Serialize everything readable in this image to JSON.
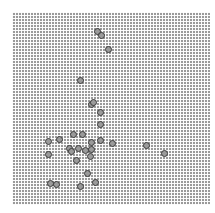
{
  "grid": {
    "x": 12,
    "y": 12,
    "width": 198,
    "height": 193,
    "pitch": 3,
    "cell_color": "#9a9a9a",
    "gap_color": "#ffffff"
  },
  "dot_color": "#3a3a3a",
  "dots": [
    {
      "x": 97,
      "y": 31
    },
    {
      "x": 101,
      "y": 35
    },
    {
      "x": 108,
      "y": 49
    },
    {
      "x": 80,
      "y": 80
    },
    {
      "x": 91,
      "y": 104
    },
    {
      "x": 93,
      "y": 102
    },
    {
      "x": 100,
      "y": 112
    },
    {
      "x": 100,
      "y": 124
    },
    {
      "x": 112,
      "y": 143
    },
    {
      "x": 146,
      "y": 145
    },
    {
      "x": 164,
      "y": 153
    },
    {
      "x": 48,
      "y": 141
    },
    {
      "x": 59,
      "y": 139
    },
    {
      "x": 48,
      "y": 154
    },
    {
      "x": 73,
      "y": 134
    },
    {
      "x": 82,
      "y": 134
    },
    {
      "x": 69,
      "y": 148
    },
    {
      "x": 71,
      "y": 151
    },
    {
      "x": 78,
      "y": 148
    },
    {
      "x": 85,
      "y": 150
    },
    {
      "x": 91,
      "y": 142
    },
    {
      "x": 91,
      "y": 149
    },
    {
      "x": 90,
      "y": 156
    },
    {
      "x": 100,
      "y": 140
    },
    {
      "x": 76,
      "y": 160
    },
    {
      "x": 87,
      "y": 173
    },
    {
      "x": 50,
      "y": 183
    },
    {
      "x": 56,
      "y": 184
    },
    {
      "x": 80,
      "y": 186
    },
    {
      "x": 95,
      "y": 182
    }
  ]
}
